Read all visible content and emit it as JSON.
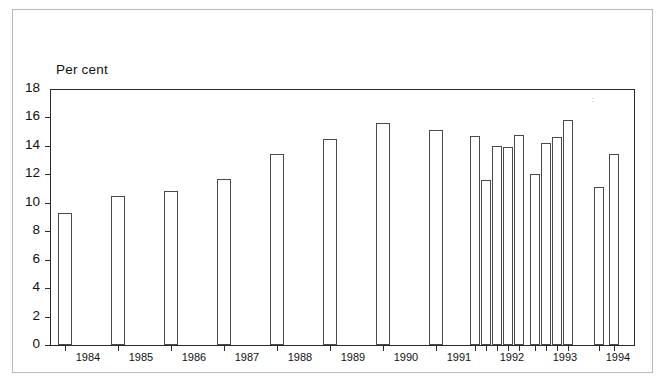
{
  "chart": {
    "axis_label": "Per cent",
    "y_ticks": [
      "18",
      "16",
      "14",
      "12",
      "10",
      "8",
      "6",
      "4",
      "2",
      "0"
    ],
    "x_ticks": [
      "1984",
      "1985",
      "1986",
      "1987",
      "1988",
      "1989",
      "1990",
      "1991",
      "1992",
      "1993",
      "1994"
    ]
  },
  "chart_data": {
    "type": "bar",
    "title": "",
    "subtitle": "",
    "xlabel": "",
    "ylabel": "Per cent",
    "ylim": [
      0,
      18
    ],
    "ytick_values": [
      0,
      2,
      4,
      6,
      8,
      10,
      12,
      14,
      16,
      18
    ],
    "xtick_labels": [
      "1984",
      "1985",
      "1986",
      "1987",
      "1988",
      "1989",
      "1990",
      "1991",
      "1992",
      "1993",
      "1994"
    ],
    "grid": false,
    "legend": null,
    "bar_style": "outline-only, white fill, thin dark border",
    "note": "Annual observations 1984-1991 followed by quarterly observations from late 1991 through 1994",
    "categories": [
      "1984",
      "1985",
      "1986",
      "1987",
      "1988",
      "1989",
      "1990",
      "1991",
      "1991 Q4",
      "1992 Q1",
      "1992 Q2",
      "1992 Q3",
      "1992 Q4",
      "1993 Q1",
      "1993 Q2",
      "1993 Q3",
      "1993 Q4",
      "1994 Q1",
      "1994 Q2"
    ],
    "values": [
      9.3,
      10.5,
      10.8,
      11.7,
      13.4,
      14.5,
      15.6,
      15.1,
      14.7,
      11.6,
      14.0,
      13.9,
      14.8,
      12.0,
      14.2,
      14.6,
      15.8,
      11.1,
      13.4
    ],
    "bar_positions_px": [
      58,
      111,
      164,
      217,
      270,
      323,
      376,
      429,
      470,
      481,
      492,
      503,
      514,
      530,
      541,
      552,
      563,
      594,
      609
    ],
    "bar_widths_px": [
      14,
      14,
      14,
      14,
      14,
      14,
      14,
      14,
      10,
      10,
      10,
      10,
      10,
      10,
      10,
      10,
      10,
      10,
      10
    ]
  }
}
